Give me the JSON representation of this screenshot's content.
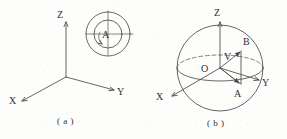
{
  "figure": {
    "background_color": "#fdfdfc",
    "ink_color": "#4a4a4a",
    "text_color": "#2e2e2e",
    "panels": [
      {
        "id": "a",
        "caption": "( a )",
        "description": "cartesian-axes-with-concentric-circles",
        "axes": [
          {
            "name": "z-axis",
            "label": "Z",
            "label_x": 57,
            "label_y": 18,
            "direction": "up"
          },
          {
            "name": "x-axis",
            "label": "X",
            "label_x": 12,
            "label_y": 104,
            "direction": "down-left"
          },
          {
            "name": "y-axis",
            "label": "Y",
            "label_x": 119,
            "label_y": 95,
            "direction": "down-right"
          }
        ],
        "origin": {
          "x": 66,
          "y": 77
        },
        "circles": {
          "name": "concentric-circles",
          "center_x": 108,
          "center_y": 34,
          "outer_radius": 22,
          "inner_radius": 14,
          "point_label": "A",
          "point_label_x": 104,
          "point_label_y": 35,
          "has_crosshair": true,
          "has_rotation_arrow": true
        }
      },
      {
        "id": "b",
        "caption": "( b )",
        "description": "sphere-with-vector-v-and-points-a-b",
        "axes": [
          {
            "name": "z-axis",
            "label": "Z",
            "label_x": 215,
            "label_y": 16,
            "direction": "up"
          },
          {
            "name": "x-axis",
            "label": "X",
            "label_x": 159,
            "label_y": 100,
            "direction": "down-left"
          },
          {
            "name": "y-axis",
            "label": "Y",
            "label_x": 264,
            "label_y": 86,
            "direction": "down-right"
          }
        ],
        "sphere": {
          "name": "sphere-outline",
          "center_x": 220,
          "center_y": 68,
          "radius": 43,
          "equator_rx": 43,
          "equator_ry": 13
        },
        "points": [
          {
            "label": "O",
            "x": 206,
            "y": 69,
            "role": "origin"
          },
          {
            "label": "V",
            "x": 218,
            "y": 58,
            "role": "vector-label"
          },
          {
            "label": "B",
            "x": 240,
            "y": 44,
            "role": "upper-point"
          },
          {
            "label": "A",
            "x": 233,
            "y": 94,
            "role": "lower-point"
          }
        ]
      }
    ]
  }
}
